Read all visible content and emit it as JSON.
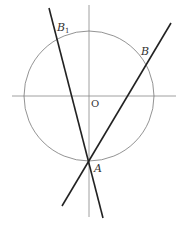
{
  "diagram": {
    "type": "geometry",
    "colors": {
      "background": "#ffffff",
      "axis": "#888888",
      "circle": "#777777",
      "line": "#222222",
      "label": "#333333"
    },
    "circle": {
      "cx": 89,
      "cy": 96,
      "r": 65
    },
    "axes": {
      "x_axis": {
        "x1": 12,
        "y1": 96,
        "x2": 176,
        "y2": 96
      },
      "y_axis": {
        "x1": 89,
        "y1": 5,
        "x2": 89,
        "y2": 217
      }
    },
    "lines": [
      {
        "name": "line-AB1",
        "x1": 49,
        "y1": 8,
        "x2": 103,
        "y2": 218
      },
      {
        "name": "line-AB",
        "x1": 171,
        "y1": 23,
        "x2": 62,
        "y2": 206
      }
    ],
    "labels": {
      "B1": {
        "text": "B",
        "subscript": "1",
        "x": 57,
        "y": 31
      },
      "B": {
        "text": "B",
        "x": 141,
        "y": 55
      },
      "O": {
        "text": "O",
        "x": 91,
        "y": 107
      },
      "A": {
        "text": "A",
        "x": 94,
        "y": 172
      }
    }
  }
}
